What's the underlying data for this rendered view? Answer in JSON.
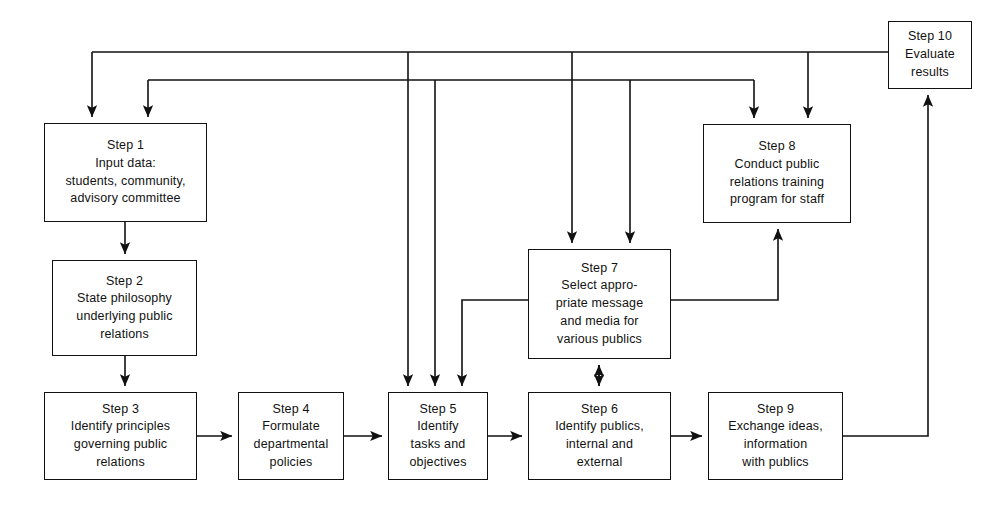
{
  "diagram": {
    "type": "flowchart",
    "background_color": "#ffffff",
    "line_color": "#111111",
    "text_color": "#111111"
  },
  "nodes": [
    {
      "id": "step1",
      "label": "Step 1",
      "lines": [
        "Step 1",
        "Input data:",
        "students, community,",
        "advisory committee"
      ],
      "x": 44,
      "y": 123,
      "w": 163,
      "h": 99
    },
    {
      "id": "step2",
      "label": "Step 2",
      "lines": [
        "Step 2",
        "State philosophy",
        "underlying public",
        "relations"
      ],
      "x": 52,
      "y": 260,
      "w": 145,
      "h": 96
    },
    {
      "id": "step3",
      "label": "Step 3",
      "lines": [
        "Step 3",
        "Identify principles",
        "governing public",
        "relations"
      ],
      "x": 44,
      "y": 392,
      "w": 153,
      "h": 88
    },
    {
      "id": "step4",
      "label": "Step 4",
      "lines": [
        "Step 4",
        "Formulate",
        "departmental",
        "policies"
      ],
      "x": 238,
      "y": 392,
      "w": 106,
      "h": 88
    },
    {
      "id": "step5",
      "label": "Step 5",
      "lines": [
        "Step 5",
        "Identify",
        "tasks and",
        "objectives"
      ],
      "x": 388,
      "y": 392,
      "w": 100,
      "h": 88
    },
    {
      "id": "step6",
      "label": "Step 6",
      "lines": [
        "Step 6",
        "Identify publics,",
        "internal and",
        "external"
      ],
      "x": 528,
      "y": 392,
      "w": 143,
      "h": 88
    },
    {
      "id": "step7",
      "label": "Step 7",
      "lines": [
        "Step 7",
        "Select appro-",
        "priate message",
        "and media for",
        "various publics"
      ],
      "x": 528,
      "y": 249,
      "w": 143,
      "h": 110
    },
    {
      "id": "step8",
      "label": "Step 8",
      "lines": [
        "Step 8",
        "Conduct public",
        "relations training",
        "program for staff"
      ],
      "x": 703,
      "y": 124,
      "w": 148,
      "h": 99
    },
    {
      "id": "step9",
      "label": "Step 9",
      "lines": [
        "Step 9",
        "Exchange ideas,",
        "information",
        "with publics"
      ],
      "x": 708,
      "y": 392,
      "w": 135,
      "h": 88
    },
    {
      "id": "step10",
      "label": "Step 10",
      "lines": [
        "Step 10",
        "Evaluate",
        "results"
      ],
      "x": 888,
      "y": 21,
      "w": 84,
      "h": 68
    }
  ],
  "connections": [
    {
      "from": "step1",
      "to": "step2",
      "kind": "arrow-down"
    },
    {
      "from": "step2",
      "to": "step3",
      "kind": "arrow-down"
    },
    {
      "from": "step3",
      "to": "step4",
      "kind": "arrow-right"
    },
    {
      "from": "step4",
      "to": "step5",
      "kind": "arrow-right"
    },
    {
      "from": "step5",
      "to": "step6",
      "kind": "arrow-right"
    },
    {
      "from": "step6",
      "to": "step9",
      "kind": "arrow-right"
    },
    {
      "from": "step7",
      "to": "step6",
      "kind": "double-arrow-vertical"
    },
    {
      "from": "step7",
      "to": "step8",
      "kind": "arrow-up-right-route"
    },
    {
      "from": "step7",
      "to": "step5",
      "kind": "arrow-left-down-route"
    },
    {
      "from": "step9",
      "to": "step10",
      "kind": "arrow-right-up-route"
    },
    {
      "from": "step10",
      "to": "step1",
      "kind": "feedback-top-trunk"
    },
    {
      "from": "step10",
      "to": "step5",
      "kind": "feedback-top-trunk"
    },
    {
      "from": "step10",
      "to": "step7",
      "kind": "feedback-top-trunk"
    },
    {
      "from": "step10",
      "to": "step8",
      "kind": "feedback-top-trunk"
    },
    {
      "from": "step8",
      "to": "step1",
      "kind": "feedback-second-trunk"
    },
    {
      "from": "step8",
      "to": "step5",
      "kind": "feedback-second-trunk"
    },
    {
      "from": "step8",
      "to": "step7",
      "kind": "feedback-second-trunk"
    }
  ]
}
